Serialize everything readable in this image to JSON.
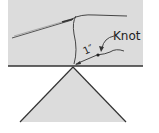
{
  "diagram": {
    "labels": {
      "knot": "Knot",
      "length": "1″"
    },
    "colors": {
      "surface_fill": "#dcdcdc",
      "stroke": "#333333",
      "background": "#ffffff"
    }
  }
}
